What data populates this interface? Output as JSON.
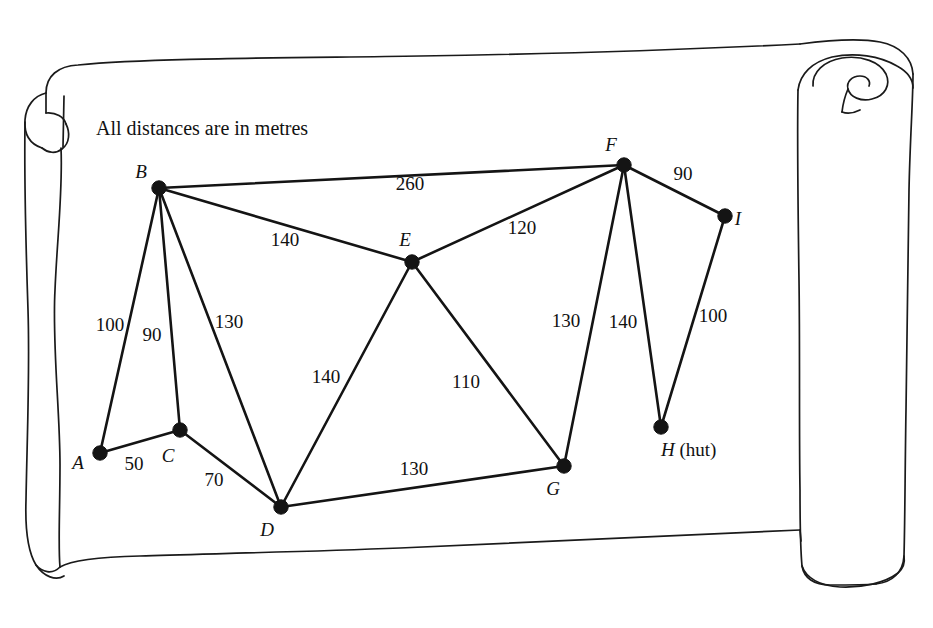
{
  "caption": "All distances are in metres",
  "graph": {
    "nodes": [
      {
        "id": "A",
        "label": "A",
        "suffix": "",
        "x": 100,
        "y": 453,
        "label_x": 78,
        "label_y": 469
      },
      {
        "id": "B",
        "label": "B",
        "suffix": "",
        "x": 159,
        "y": 188,
        "label_x": 141,
        "label_y": 178
      },
      {
        "id": "C",
        "label": "C",
        "suffix": "",
        "x": 180,
        "y": 430,
        "label_x": 168,
        "label_y": 462
      },
      {
        "id": "D",
        "label": "D",
        "suffix": "",
        "x": 281,
        "y": 507,
        "label_x": 267,
        "label_y": 536
      },
      {
        "id": "E",
        "label": "E",
        "suffix": "",
        "x": 412,
        "y": 262,
        "label_x": 405,
        "label_y": 246
      },
      {
        "id": "F",
        "label": "F",
        "suffix": "",
        "x": 624,
        "y": 165,
        "label_x": 611,
        "label_y": 151
      },
      {
        "id": "G",
        "label": "G",
        "suffix": "",
        "x": 564,
        "y": 466,
        "label_x": 553,
        "label_y": 495
      },
      {
        "id": "H",
        "label": "H",
        "suffix": " (hut)",
        "x": 661,
        "y": 427,
        "label_x": 661,
        "label_y": 456
      },
      {
        "id": "I",
        "label": "I",
        "suffix": "",
        "x": 725,
        "y": 216,
        "label_x": 738,
        "label_y": 225
      }
    ],
    "edges": [
      {
        "from": "A",
        "to": "B",
        "weight": "100",
        "label_x": 110,
        "label_y": 331
      },
      {
        "from": "A",
        "to": "C",
        "weight": "50",
        "label_x": 134,
        "label_y": 470
      },
      {
        "from": "B",
        "to": "C",
        "weight": "90",
        "label_x": 152,
        "label_y": 341
      },
      {
        "from": "B",
        "to": "D",
        "weight": "130",
        "label_x": 229,
        "label_y": 328
      },
      {
        "from": "B",
        "to": "E",
        "weight": "140",
        "label_x": 285,
        "label_y": 246
      },
      {
        "from": "B",
        "to": "F",
        "weight": "260",
        "label_x": 410,
        "label_y": 190
      },
      {
        "from": "C",
        "to": "D",
        "weight": "70",
        "label_x": 214,
        "label_y": 486
      },
      {
        "from": "D",
        "to": "E",
        "weight": "140",
        "label_x": 326,
        "label_y": 383
      },
      {
        "from": "D",
        "to": "G",
        "weight": "130",
        "label_x": 414,
        "label_y": 475
      },
      {
        "from": "E",
        "to": "F",
        "weight": "120",
        "label_x": 522,
        "label_y": 234
      },
      {
        "from": "E",
        "to": "G",
        "weight": "110",
        "label_x": 466,
        "label_y": 388
      },
      {
        "from": "F",
        "to": "G",
        "weight": "130",
        "label_x": 566,
        "label_y": 327
      },
      {
        "from": "F",
        "to": "H",
        "weight": "140",
        "label_x": 623,
        "label_y": 328
      },
      {
        "from": "F",
        "to": "I",
        "weight": "90",
        "label_x": 683,
        "label_y": 180
      },
      {
        "from": "H",
        "to": "I",
        "weight": "100",
        "label_x": 713,
        "label_y": 322
      }
    ]
  },
  "colors": {
    "ink": "#1a1a1a",
    "parchment": "#ffffff",
    "node": "#141414"
  }
}
